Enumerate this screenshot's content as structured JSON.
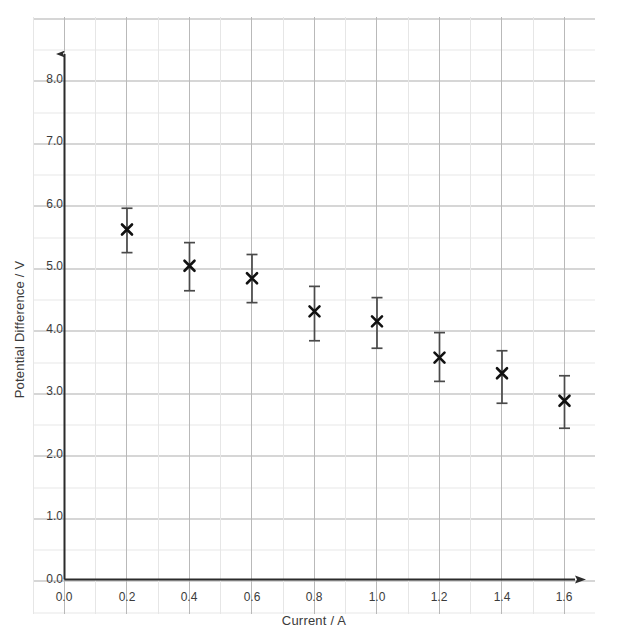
{
  "chart_data": {
    "type": "scatter",
    "title": "",
    "xlabel": "Current / A",
    "ylabel": "Potential Difference / V",
    "xlim": [
      0.0,
      1.8
    ],
    "ylim": [
      0.0,
      8.4
    ],
    "grid": true,
    "legend": null,
    "marker": "x",
    "error_bars": "y",
    "x_ticks": [
      "0.0",
      "0.2",
      "0.4",
      "0.6",
      "0.8",
      "1.0",
      "1.2",
      "1.4",
      "1.6"
    ],
    "x_tick_values": [
      0.0,
      0.2,
      0.4,
      0.6,
      0.8,
      1.0,
      1.2,
      1.4,
      1.6
    ],
    "y_ticks": [
      "0.0",
      "1.0",
      "2.0",
      "3.0",
      "4.0",
      "5.0",
      "6.0",
      "7.0",
      "8.0"
    ],
    "y_tick_values": [
      0.0,
      1.0,
      2.0,
      3.0,
      4.0,
      5.0,
      6.0,
      7.0,
      8.0
    ],
    "x": [
      0.2,
      0.4,
      0.6,
      0.8,
      1.0,
      1.2,
      1.4,
      1.6
    ],
    "values": [
      5.6,
      5.02,
      4.82,
      4.29,
      4.13,
      3.55,
      3.3,
      2.86
    ],
    "y_err_upper": [
      5.94,
      5.39,
      5.2,
      4.69,
      4.51,
      3.95,
      3.66,
      3.26
    ],
    "y_err_lower": [
      5.23,
      4.62,
      4.43,
      3.82,
      3.7,
      3.17,
      2.82,
      2.42
    ],
    "points": [
      {
        "x": 0.2,
        "y": 5.6,
        "err_plus": 0.34,
        "err_minus": 0.37
      },
      {
        "x": 0.4,
        "y": 5.02,
        "err_plus": 0.37,
        "err_minus": 0.4
      },
      {
        "x": 0.6,
        "y": 4.82,
        "err_plus": 0.38,
        "err_minus": 0.39
      },
      {
        "x": 0.8,
        "y": 4.29,
        "err_plus": 0.4,
        "err_minus": 0.47
      },
      {
        "x": 1.0,
        "y": 4.13,
        "err_plus": 0.38,
        "err_minus": 0.43
      },
      {
        "x": 1.2,
        "y": 3.55,
        "err_plus": 0.4,
        "err_minus": 0.38
      },
      {
        "x": 1.4,
        "y": 3.3,
        "err_plus": 0.36,
        "err_minus": 0.48
      },
      {
        "x": 1.6,
        "y": 2.86,
        "err_plus": 0.4,
        "err_minus": 0.44
      }
    ]
  },
  "colors": {
    "axis": "#2b2b2b",
    "marker": "#111111",
    "error_bar": "#4a4a4a",
    "grid_major": "#b9b9b9",
    "grid_minor": "#e6e6e6",
    "text": "#3b3b3b",
    "background": "#ffffff"
  },
  "axes": {
    "x_title": "Current / A",
    "y_title": "Potential Difference / V"
  },
  "header": {
    "faint_text": ""
  }
}
